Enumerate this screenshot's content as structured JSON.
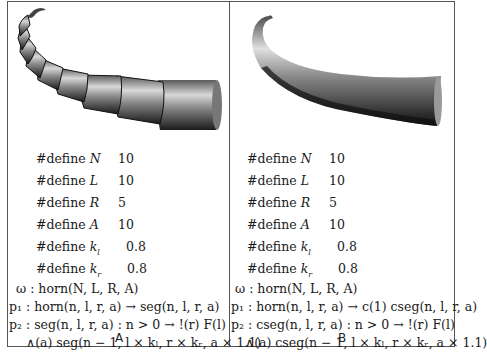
{
  "panels": [
    {
      "id": "A",
      "caption": "A",
      "image": {
        "description": "horn built from discrete cylinder segments",
        "style": "segmented"
      },
      "defines": [
        {
          "keyword": "#define",
          "name": "N",
          "value": "10"
        },
        {
          "keyword": "#define",
          "name": "L",
          "value": "10"
        },
        {
          "keyword": "#define",
          "name": "R",
          "value": "5"
        },
        {
          "keyword": "#define",
          "name": "A",
          "value": "10"
        },
        {
          "keyword": "#define",
          "name": "k",
          "sub": "l",
          "value": "0.8"
        },
        {
          "keyword": "#define",
          "name": "k",
          "sub": "r",
          "value": "0.8"
        }
      ],
      "rules": {
        "axiom": "ω : horn(N, L, R, A)",
        "p1": "p₁ : horn(n, l, r, a) → seg(n, l, r, a)",
        "p2": "p₂ : seg(n, l, r, a) : n > 0 → !(r) F(l)",
        "p2_cont": "∧(a) seg(n − 1, l × kₗ, r × kᵣ, a × 1.1)"
      }
    },
    {
      "id": "B",
      "caption": "B",
      "image": {
        "description": "horn built from continuous generalized cylinder",
        "style": "smooth"
      },
      "defines": [
        {
          "keyword": "#define",
          "name": "N",
          "value": "10"
        },
        {
          "keyword": "#define",
          "name": "L",
          "value": "10"
        },
        {
          "keyword": "#define",
          "name": "R",
          "value": "5"
        },
        {
          "keyword": "#define",
          "name": "A",
          "value": "10"
        },
        {
          "keyword": "#define",
          "name": "k",
          "sub": "l",
          "value": "0.8"
        },
        {
          "keyword": "#define",
          "name": "k",
          "sub": "r",
          "value": "0.8"
        }
      ],
      "rules": {
        "axiom": "ω : horn(N, L, R, A)",
        "p1": "p₁ : horn(n, l, r, a) → c(1) cseg(n, l, r, a)",
        "p2": "p₂ : cseg(n, l, r, a) : n > 0 → !(r) F(l)",
        "p2_cont": "∧(a) cseg(n − 1, l × kₗ, r × kᵣ, a × 1.1)"
      }
    }
  ]
}
